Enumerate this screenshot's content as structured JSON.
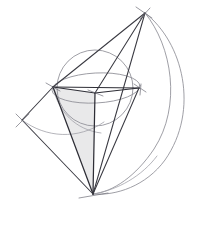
{
  "figure": {
    "type": "line-drawing",
    "canvas": {
      "width": 205,
      "height": 250
    },
    "background_color": "#ffffff",
    "stroke_color": "#3a3a42",
    "arc_color": "#8e8e96",
    "shade_color": "#e9e9ea"
  },
  "points": {
    "apex_top": {
      "label": "top apex",
      "x": 145,
      "y": 13
    },
    "apex_bottom": {
      "label": "bottom apex",
      "x": 93,
      "y": 194
    },
    "vertex_left": {
      "label": "left vertex",
      "x": 53,
      "y": 87
    },
    "vertex_right": {
      "label": "right vertex",
      "x": 139,
      "y": 88
    },
    "center_hub": {
      "label": "center hub",
      "x": 95,
      "y": 93
    },
    "node_far_left": {
      "label": "far left crossing",
      "x": 22,
      "y": 120
    }
  },
  "edges": [
    {
      "name": "apex-top-to-left-vertex",
      "from": "apex_top",
      "to": "vertex_left"
    },
    {
      "name": "apex-top-to-center-hub",
      "from": "apex_top",
      "to": "center_hub"
    },
    {
      "name": "apex-top-to-bottom-apex",
      "from": "apex_top",
      "to": "apex_bottom"
    },
    {
      "name": "left-vertex-to-right-vertex",
      "from": "vertex_left",
      "to": "vertex_right"
    },
    {
      "name": "left-vertex-to-center-hub",
      "from": "vertex_left",
      "to": "center_hub"
    },
    {
      "name": "center-hub-to-right-vertex",
      "from": "center_hub",
      "to": "vertex_right"
    },
    {
      "name": "center-hub-to-bottom-apex",
      "from": "center_hub",
      "to": "apex_bottom"
    },
    {
      "name": "left-vertex-to-bottom-apex",
      "from": "vertex_left",
      "to": "apex_bottom"
    },
    {
      "name": "right-vertex-to-bottom-apex",
      "from": "vertex_right",
      "to": "apex_bottom"
    },
    {
      "name": "left-vertex-to-far-left",
      "from": "vertex_left",
      "to": "node_far_left"
    },
    {
      "name": "far-left-to-bottom-apex",
      "from": "node_far_left",
      "to": "apex_bottom"
    }
  ],
  "shaded_faces": [
    {
      "name": "cone-front-face",
      "vertices": [
        "vertex_left",
        "center_hub",
        "apex_bottom"
      ],
      "fill": "#e9e9ea"
    }
  ],
  "circles": [
    {
      "name": "base-circle",
      "cx": 95,
      "cy": 88,
      "r": 38,
      "stroke": "#9a9aa2"
    }
  ],
  "ellipses": [
    {
      "name": "base-ellipse-perspective",
      "cx": 96,
      "cy": 88,
      "rx": 44,
      "ry": 15,
      "rotation": -3,
      "stroke": "#9a9aa2"
    }
  ],
  "arcs": [
    {
      "name": "outer-right-sweep-arc",
      "description": "large arc from top apex sweeping right and down to bottom apex",
      "path": "M 145 13 C 183 42, 200 110, 165 160 C 146 186, 116 196, 93 194"
    },
    {
      "name": "inner-right-sweep-arc",
      "description": "second arc inside the outer sweep",
      "path": "M 145 13 C 172 46, 182 106, 154 149 C 136 176, 113 192, 93 194"
    },
    {
      "name": "lower-right-short-arc",
      "description": "shallow arc returning toward bottom apex",
      "path": "M 93 194 C 118 190, 142 176, 157 156"
    },
    {
      "name": "left-lower-arc",
      "description": "arc sweeping through left region below circle",
      "path": "M 22 120 C 46 138, 78 140, 104 122"
    },
    {
      "name": "left-cone-arc",
      "description": "arc from left vertex curving down through shaded face",
      "path": "M 53 87 C 58 112, 76 130, 101 133"
    }
  ],
  "tick_marks": [
    {
      "name": "tick-top-apex-a",
      "x1": 136,
      "y1": 7,
      "x2": 152,
      "y2": 18
    },
    {
      "name": "tick-top-apex-b",
      "x1": 140,
      "y1": 19,
      "x2": 150,
      "y2": 8
    },
    {
      "name": "tick-right-vertex",
      "x1": 134,
      "y1": 84,
      "x2": 146,
      "y2": 92
    },
    {
      "name": "tick-right-vertex-b",
      "x1": 140,
      "y1": 95,
      "x2": 141,
      "y2": 84
    },
    {
      "name": "tick-left-vertex",
      "x1": 46,
      "y1": 83,
      "x2": 60,
      "y2": 91
    },
    {
      "name": "tick-far-left",
      "x1": 16,
      "y1": 114,
      "x2": 29,
      "y2": 127
    },
    {
      "name": "tick-far-left-b",
      "x1": 16,
      "y1": 127,
      "x2": 29,
      "y2": 114
    },
    {
      "name": "tick-bottom-apex",
      "x1": 79,
      "y1": 198,
      "x2": 108,
      "y2": 193
    },
    {
      "name": "tick-center-hub",
      "x1": 88,
      "y1": 90,
      "x2": 103,
      "y2": 96
    }
  ]
}
